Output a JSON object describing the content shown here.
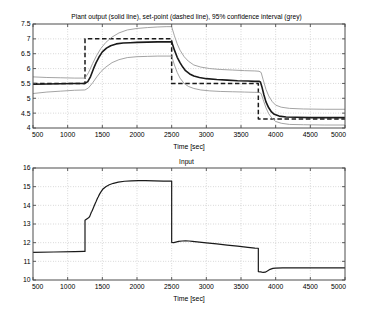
{
  "figure": {
    "width": 373,
    "height": 316,
    "background": "#ffffff"
  },
  "chart_data": [
    {
      "id": "plant-output",
      "type": "line",
      "title": "Plant output (solid line), set-point (dashed line), 95% confidence interval (grey)",
      "xlabel": "Time [sec]",
      "ylabel": "",
      "xlim": [
        500,
        5000
      ],
      "ylim": [
        4,
        7.5
      ],
      "xticks": [
        500,
        1000,
        1500,
        2000,
        2500,
        3000,
        3500,
        4000,
        4500,
        5000
      ],
      "yticks": [
        4,
        4.5,
        5,
        5.5,
        6,
        6.5,
        7,
        7.5
      ],
      "grid": true,
      "legend": "none",
      "series": [
        {
          "name": "Plant output",
          "style": "solid",
          "color": "#1a1a1a",
          "width": 1.6,
          "x": [
            500,
            700,
            900,
            1100,
            1240,
            1250,
            1290,
            1330,
            1370,
            1410,
            1450,
            1500,
            1560,
            1620,
            1700,
            1800,
            1900,
            2000,
            2150,
            2300,
            2420,
            2490,
            2500,
            2540,
            2580,
            2620,
            2660,
            2700,
            2760,
            2820,
            2900,
            3000,
            3150,
            3300,
            3450,
            3600,
            3700,
            3760,
            3780,
            3800,
            3830,
            3860,
            3900,
            3940,
            3980,
            4050,
            4150,
            4300,
            4500,
            4750,
            5000
          ],
          "y": [
            5.47,
            5.48,
            5.49,
            5.5,
            5.5,
            5.5,
            5.56,
            5.73,
            5.98,
            6.2,
            6.38,
            6.56,
            6.69,
            6.77,
            6.83,
            6.86,
            6.87,
            6.88,
            6.89,
            6.9,
            6.9,
            6.9,
            6.9,
            6.62,
            6.38,
            6.2,
            6.05,
            5.93,
            5.82,
            5.75,
            5.7,
            5.66,
            5.63,
            5.61,
            5.59,
            5.58,
            5.57,
            5.57,
            5.55,
            5.4,
            5.12,
            4.88,
            4.68,
            4.54,
            4.46,
            4.4,
            4.37,
            4.36,
            4.35,
            4.35,
            4.35
          ]
        },
        {
          "name": "Set-point",
          "style": "dashed",
          "color": "#1a1a1a",
          "width": 1.5,
          "x": [
            500,
            1250,
            1250,
            2500,
            2500,
            3750,
            3750,
            5000
          ],
          "y": [
            5.5,
            5.5,
            7.0,
            7.0,
            5.5,
            5.5,
            4.3,
            4.3
          ]
        },
        {
          "name": "95% confidence interval upper",
          "style": "solid",
          "color": "#9a9a9a",
          "width": 0.9,
          "x": [
            500,
            700,
            900,
            1100,
            1240,
            1250,
            1300,
            1360,
            1420,
            1480,
            1550,
            1640,
            1740,
            1860,
            2000,
            2150,
            2300,
            2420,
            2490,
            2500,
            2540,
            2580,
            2620,
            2680,
            2740,
            2820,
            2920,
            3050,
            3200,
            3380,
            3550,
            3700,
            3760,
            3790,
            3820,
            3860,
            3900,
            3950,
            4000,
            4080,
            4200,
            4400,
            4700,
            5000
          ],
          "y": [
            5.72,
            5.7,
            5.69,
            5.68,
            5.68,
            5.68,
            5.86,
            6.17,
            6.45,
            6.68,
            6.88,
            7.06,
            7.2,
            7.3,
            7.35,
            7.38,
            7.4,
            7.41,
            7.41,
            7.41,
            7.1,
            6.83,
            6.62,
            6.4,
            6.25,
            6.12,
            6.05,
            6.0,
            5.97,
            5.95,
            5.93,
            5.92,
            5.91,
            5.87,
            5.62,
            5.3,
            5.08,
            4.89,
            4.77,
            4.7,
            4.66,
            4.64,
            4.63,
            4.63
          ]
        },
        {
          "name": "95% confidence interval lower",
          "style": "solid",
          "color": "#9a9a9a",
          "width": 0.9,
          "x": [
            500,
            700,
            900,
            1100,
            1240,
            1250,
            1300,
            1360,
            1420,
            1480,
            1550,
            1640,
            1740,
            1860,
            2000,
            2150,
            2300,
            2420,
            2490,
            2500,
            2540,
            2580,
            2620,
            2680,
            2740,
            2820,
            2920,
            3050,
            3200,
            3380,
            3550,
            3700,
            3760,
            3790,
            3820,
            3860,
            3900,
            3950,
            4000,
            4080,
            4200,
            4400,
            4700,
            5000
          ],
          "y": [
            5.16,
            5.21,
            5.24,
            5.27,
            5.28,
            5.28,
            5.35,
            5.52,
            5.72,
            5.9,
            6.05,
            6.2,
            6.3,
            6.37,
            6.4,
            6.41,
            6.42,
            6.42,
            6.42,
            6.42,
            6.12,
            5.87,
            5.68,
            5.5,
            5.4,
            5.33,
            5.28,
            5.25,
            5.23,
            5.22,
            5.21,
            5.2,
            5.2,
            5.16,
            4.95,
            4.68,
            4.48,
            4.32,
            4.22,
            4.16,
            4.12,
            4.11,
            4.1,
            4.1
          ]
        }
      ]
    },
    {
      "id": "input",
      "type": "line",
      "title": "Input",
      "xlabel": "Time [sec]",
      "ylabel": "",
      "xlim": [
        500,
        5000
      ],
      "ylim": [
        10,
        16
      ],
      "xticks": [
        500,
        1000,
        1500,
        2000,
        2500,
        3000,
        3500,
        4000,
        4500,
        5000
      ],
      "yticks": [
        10,
        11,
        12,
        13,
        14,
        15,
        16
      ],
      "grid": true,
      "legend": "none",
      "series": [
        {
          "name": "Input",
          "style": "solid",
          "color": "#1a1a1a",
          "width": 1.2,
          "x": [
            500,
            800,
            1100,
            1240,
            1250,
            1250,
            1280,
            1290,
            1310,
            1320,
            1340,
            1350,
            1370,
            1380,
            1400,
            1410,
            1430,
            1440,
            1460,
            1480,
            1510,
            1550,
            1600,
            1660,
            1730,
            1820,
            1920,
            2020,
            2120,
            2250,
            2380,
            2490,
            2500,
            2500,
            2530,
            2560,
            2600,
            2650,
            2700,
            2750,
            2800,
            2900,
            3000,
            3150,
            3300,
            3450,
            3600,
            3700,
            3745,
            3750,
            3750,
            3780,
            3800,
            3820,
            3850,
            3880,
            3920,
            3960,
            4000,
            4100,
            4250,
            4450,
            4700,
            5000
          ],
          "y": [
            11.48,
            11.5,
            11.52,
            11.53,
            11.53,
            13.2,
            13.28,
            13.3,
            13.36,
            13.42,
            13.62,
            13.68,
            13.86,
            13.95,
            14.12,
            14.2,
            14.38,
            14.45,
            14.6,
            14.72,
            14.88,
            15.0,
            15.1,
            15.18,
            15.24,
            15.29,
            15.31,
            15.32,
            15.32,
            15.31,
            15.3,
            15.3,
            15.3,
            12.02,
            12.0,
            12.03,
            12.07,
            12.09,
            12.1,
            12.09,
            12.07,
            12.03,
            11.99,
            11.93,
            11.87,
            11.81,
            11.75,
            11.71,
            11.7,
            11.7,
            10.45,
            10.44,
            10.42,
            10.41,
            10.42,
            10.48,
            10.57,
            10.62,
            10.64,
            10.65,
            10.65,
            10.65,
            10.65,
            10.65
          ]
        }
      ]
    }
  ],
  "axes_output": {
    "title": "Plant output (solid line), set-point (dashed line), 95% confidence interval (grey)",
    "xlabel": "Time [sec]",
    "xtick_labels": [
      "500",
      "1000",
      "1500",
      "2000",
      "2500",
      "3000",
      "3500",
      "4000",
      "4500",
      "5000"
    ],
    "ytick_labels": [
      "4",
      "4.5",
      "5",
      "5.5",
      "6",
      "6.5",
      "7",
      "7.5"
    ]
  },
  "axes_input": {
    "title": "Input",
    "xlabel": "Time [sec]",
    "xtick_labels": [
      "500",
      "1000",
      "1500",
      "2000",
      "2500",
      "3000",
      "3500",
      "4000",
      "4500",
      "5000"
    ],
    "ytick_labels": [
      "10",
      "11",
      "12",
      "13",
      "14",
      "15",
      "16"
    ]
  },
  "colors": {
    "line": "#1a1a1a",
    "confidence": "#9a9a9a",
    "grid": "#b0b0b0",
    "axis": "#4d4d4d",
    "background": "#ffffff"
  }
}
